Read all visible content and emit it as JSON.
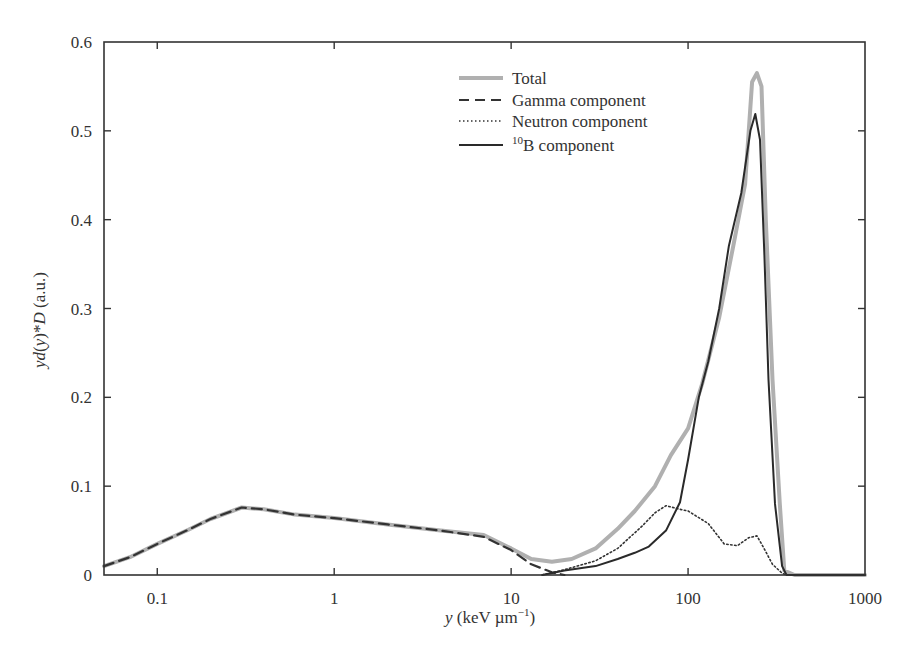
{
  "chart_data": {
    "type": "line",
    "title": "",
    "xlabel": "y (keV µm⁻¹)",
    "ylabel": "yd(y)*D (a.u.)",
    "xscale": "log",
    "xlim": [
      0.05,
      1000
    ],
    "ylim": [
      0,
      0.6
    ],
    "x_ticks": [
      {
        "value": 0.1,
        "label": "0.1"
      },
      {
        "value": 1,
        "label": "1"
      },
      {
        "value": 10,
        "label": "10"
      },
      {
        "value": 100,
        "label": "100"
      },
      {
        "value": 1000,
        "label": "1000"
      }
    ],
    "y_ticks": [
      {
        "value": 0,
        "label": "0"
      },
      {
        "value": 0.1,
        "label": "0.1"
      },
      {
        "value": 0.2,
        "label": "0.2"
      },
      {
        "value": 0.3,
        "label": "0.3"
      },
      {
        "value": 0.4,
        "label": "0.4"
      },
      {
        "value": 0.5,
        "label": "0.5"
      },
      {
        "value": 0.6,
        "label": "0.6"
      }
    ],
    "grid": false,
    "legend_position": "upper-center-right",
    "series": [
      {
        "name": "Total",
        "style": "solid-thick",
        "color": "#b0b0b0",
        "x": [
          0.05,
          0.07,
          0.1,
          0.15,
          0.2,
          0.3,
          0.4,
          0.6,
          1,
          2,
          4,
          7,
          10,
          13,
          17,
          22,
          30,
          40,
          50,
          65,
          80,
          100,
          120,
          150,
          180,
          210,
          230,
          245,
          260,
          275,
          300,
          330,
          350,
          400,
          600,
          1000
        ],
        "y": [
          0.01,
          0.02,
          0.035,
          0.051,
          0.063,
          0.076,
          0.074,
          0.068,
          0.064,
          0.057,
          0.05,
          0.045,
          0.03,
          0.018,
          0.015,
          0.018,
          0.03,
          0.052,
          0.072,
          0.1,
          0.135,
          0.165,
          0.215,
          0.29,
          0.37,
          0.44,
          0.555,
          0.565,
          0.55,
          0.4,
          0.22,
          0.08,
          0.005,
          0.0,
          0.0,
          0.0
        ]
      },
      {
        "name": "Gamma component",
        "style": "dashed",
        "color": "#333333",
        "x": [
          0.05,
          0.07,
          0.1,
          0.15,
          0.2,
          0.3,
          0.4,
          0.6,
          1,
          2,
          4,
          7,
          10,
          13,
          17,
          20
        ],
        "y": [
          0.01,
          0.02,
          0.035,
          0.051,
          0.063,
          0.076,
          0.074,
          0.068,
          0.064,
          0.057,
          0.05,
          0.043,
          0.028,
          0.012,
          0.003,
          0.0
        ]
      },
      {
        "name": "Neutron component",
        "style": "dotted",
        "color": "#333333",
        "x": [
          15,
          20,
          30,
          40,
          55,
          65,
          75,
          90,
          100,
          130,
          160,
          190,
          220,
          245,
          265,
          300,
          340,
          360,
          1000
        ],
        "y": [
          0.0,
          0.006,
          0.016,
          0.03,
          0.055,
          0.07,
          0.078,
          0.074,
          0.072,
          0.058,
          0.035,
          0.033,
          0.042,
          0.044,
          0.032,
          0.012,
          0.002,
          0.0,
          0.0
        ]
      },
      {
        "name": "10B component",
        "style": "solid",
        "color": "#2a2a2a",
        "x": [
          15,
          20,
          30,
          40,
          50,
          60,
          75,
          90,
          100,
          115,
          130,
          150,
          170,
          200,
          225,
          240,
          255,
          270,
          285,
          310,
          340,
          360,
          1000
        ],
        "y": [
          0.0,
          0.005,
          0.01,
          0.018,
          0.025,
          0.032,
          0.05,
          0.082,
          0.13,
          0.2,
          0.24,
          0.3,
          0.37,
          0.43,
          0.5,
          0.519,
          0.49,
          0.36,
          0.22,
          0.08,
          0.01,
          0.0,
          0.0
        ]
      }
    ]
  },
  "legend": {
    "items": [
      {
        "label": "Total"
      },
      {
        "label": "Gamma component"
      },
      {
        "label": "Neutron component"
      },
      {
        "label_sup": "10",
        "label": "B component"
      }
    ]
  },
  "axes": {
    "xlabel_var": "y",
    "xlabel_units": " (keV µm",
    "xlabel_exp": "−1",
    "xlabel_close": ")",
    "ylabel_parts": {
      "a": "yd",
      "b": "(",
      "c": "y",
      "d": ")*",
      "e": "D",
      "f": " (a.u.)"
    }
  }
}
